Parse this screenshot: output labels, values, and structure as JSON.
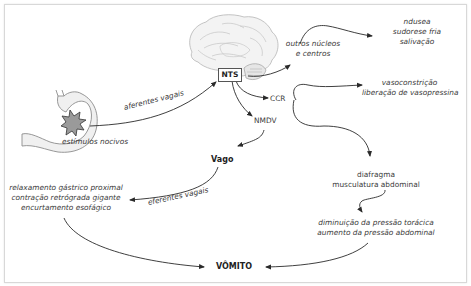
{
  "diagram": {
    "colors": {
      "line": "#2a2a2a",
      "text": "#3a3a3a",
      "organ_fill": "#efefef",
      "organ_stroke": "#9a9a9a",
      "frame_border": "#d8d8d8"
    },
    "nodes": {
      "nts": "NTS",
      "stimulus": "estímulos nocivos",
      "other_nuclei": [
        "outros núcleos",
        "e centros"
      ],
      "nausea_group": [
        "ndusea",
        "sudorese fria",
        "salivação"
      ],
      "ccr": "CCR",
      "vaso_group": [
        "vasoconstrição",
        "liberação de vasopressina"
      ],
      "nmdv": "NMDV",
      "vago": "Vago",
      "diaphragm_group": [
        "diafragma",
        "musculatura abdominal"
      ],
      "pressure_group": [
        "diminuição da pressão torácica",
        "aumento da pressão abdominal"
      ],
      "gastric_group": [
        "relaxamento gástrico proximal",
        "contração retrógrada gigante",
        "encurtamento esofágico"
      ],
      "vomit": "VÔMITO"
    },
    "edge_labels": {
      "afferent": "aferentes vagais",
      "efferent": "eferentes vagais"
    },
    "icons": {
      "brain": "brain-icon",
      "stomach": "stomach-icon",
      "stimulus_burst": "burst-icon"
    }
  }
}
